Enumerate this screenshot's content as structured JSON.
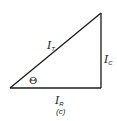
{
  "diagram": {
    "type": "phasor-triangle",
    "line_color": "#1a1a1a",
    "vertices": {
      "origin": [
        10,
        88
      ],
      "right_angle": [
        101,
        88
      ],
      "apex": [
        101,
        13
      ]
    },
    "labels": {
      "hypotenuse": {
        "main": "I",
        "sub": "T"
      },
      "vertical": {
        "main": "I",
        "sub": "C"
      },
      "horizontal": {
        "main": "I",
        "sub": "R"
      },
      "angle": "Θ"
    },
    "caption": "(c)"
  }
}
